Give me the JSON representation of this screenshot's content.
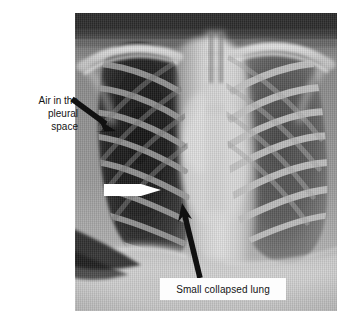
{
  "figure": {
    "kind": "annotated-chest-radiograph",
    "background_color": "#ffffff",
    "caption_text_color": "#151515"
  },
  "radiograph": {
    "name": "chest-xray-pneumothorax",
    "modality_label": "",
    "plate": {
      "x": 75,
      "y": 13,
      "width": 262,
      "height": 298
    },
    "base_color": "#8e8e8e"
  },
  "annotations": {
    "air_pleural": {
      "lines": [
        "Air in the",
        "pleural",
        "space"
      ],
      "line1": "Air in the",
      "line2": "pleural",
      "line3": "space",
      "arrow": {
        "color": "#111111",
        "from_x": 72,
        "from_y": 99,
        "to_x": 114,
        "to_y": 130
      }
    },
    "white_marker": {
      "color": "#ffffff",
      "from_x": 104,
      "from_y": 190,
      "to_x": 161,
      "to_y": 190
    },
    "collapsed_lung": {
      "label": "Small collapsed lung",
      "box_color": "#fdfdfd",
      "arrow": {
        "color": "#111111",
        "from_x": 200,
        "from_y": 277,
        "to_x": 182,
        "to_y": 203
      }
    }
  }
}
